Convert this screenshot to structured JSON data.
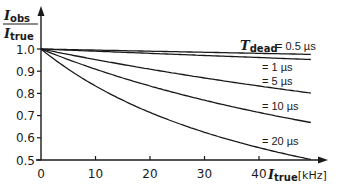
{
  "chart_data": {
    "type": "line",
    "title": "",
    "xlabel": "I_true [kHz]",
    "ylabel": "I_obs / I_true",
    "xlim": [
      0,
      50
    ],
    "ylim": [
      0.5,
      1.05
    ],
    "grid": false,
    "legend_position": "inline labels at right end of curves",
    "x_ticks": [
      0,
      10,
      20,
      30,
      40
    ],
    "y_ticks": [
      0.5,
      0.6,
      0.7,
      0.8,
      0.9,
      1.0
    ],
    "x_tick_labels": [
      "0",
      "10",
      "20",
      "30",
      "40"
    ],
    "y_tick_labels": [
      "0.5",
      "0.6",
      "0.7",
      "0.8",
      "0.9",
      "1.0"
    ],
    "x": [
      0,
      5,
      10,
      15,
      20,
      25,
      30,
      35,
      40,
      45,
      49
    ],
    "series": [
      {
        "name": "T_dead = 0.5 µs",
        "label": "= 0.5 µs",
        "tau_us": 0.5,
        "values": [
          1.0,
          0.998,
          0.995,
          0.993,
          0.99,
          0.988,
          0.985,
          0.983,
          0.98,
          0.978,
          0.976
        ]
      },
      {
        "name": "T_dead = 1 µs",
        "label": "= 1 µs",
        "tau_us": 1,
        "values": [
          1.0,
          0.995,
          0.99,
          0.985,
          0.98,
          0.976,
          0.971,
          0.966,
          0.962,
          0.957,
          0.953
        ]
      },
      {
        "name": "T_dead = 5 µs",
        "label": "= 5 µs",
        "tau_us": 5,
        "values": [
          1.0,
          0.976,
          0.952,
          0.93,
          0.909,
          0.889,
          0.87,
          0.851,
          0.833,
          0.816,
          0.803
        ]
      },
      {
        "name": "T_dead = 10 µs",
        "label": "= 10 µs",
        "tau_us": 10,
        "values": [
          1.0,
          0.952,
          0.909,
          0.87,
          0.833,
          0.8,
          0.769,
          0.741,
          0.714,
          0.69,
          0.671
        ]
      },
      {
        "name": "T_dead = 20 µs",
        "label": "= 20 µs",
        "tau_us": 20,
        "values": [
          1.0,
          0.909,
          0.833,
          0.769,
          0.714,
          0.667,
          0.625,
          0.588,
          0.556,
          0.526,
          0.505
        ]
      }
    ]
  },
  "labels": {
    "y_num_main": "I",
    "y_num_sub": "obs",
    "y_den_main": "I",
    "y_den_sub": "true",
    "x_main": "I",
    "x_sub": "true",
    "x_unit": "[kHz]",
    "legend_prefix_main": "T",
    "legend_prefix_sub": "dead"
  },
  "colors": {
    "line": "#1a1a1a",
    "background": "#ffffff"
  }
}
